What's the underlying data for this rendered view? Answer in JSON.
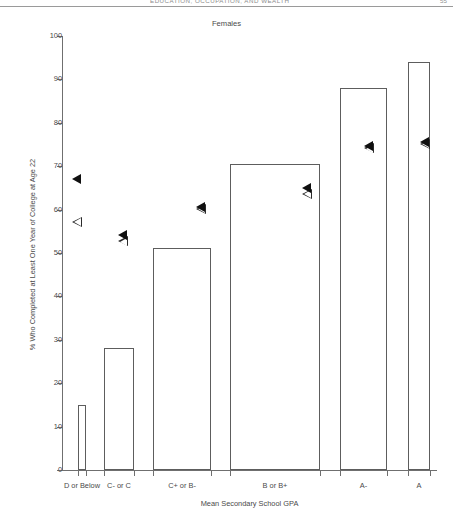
{
  "running_head": {
    "text": "EDUCATION, OCCUPATION, AND WEALTH",
    "page_number": "55"
  },
  "figure": {
    "title": "Females"
  },
  "chart_data": {
    "type": "bar",
    "title": "Females",
    "xlabel": "Mean Secondary School GPA",
    "ylabel": "% Who Completed at Least One Year of College at Age 22",
    "categories": [
      "D or Below",
      "C- or C",
      "C+ or B-",
      "B or B+",
      "A-",
      "A"
    ],
    "values": [
      15,
      28,
      51.2,
      70.5,
      88,
      94
    ],
    "ylim": [
      0,
      100
    ],
    "yticks": [
      0,
      10,
      20,
      30,
      40,
      50,
      60,
      70,
      80,
      90,
      100
    ],
    "ytick_labels": [
      "0",
      "10",
      "20",
      "30",
      "40",
      "50",
      "60",
      "70",
      "80",
      "90",
      "100"
    ],
    "grid": false,
    "legend": "none",
    "bar_widths_note": "Bar width varies by category, proportional to group sample size",
    "series": [
      {
        "name": "Bar: % completed at least one year of college",
        "marker": "bar-outline",
        "values": [
          15,
          28,
          51.2,
          70.5,
          88,
          94
        ]
      },
      {
        "name": "Filled triangle marker",
        "marker": "filled-left-triangle",
        "values": [
          67,
          54,
          60.5,
          65,
          74.5,
          75.5
        ]
      },
      {
        "name": "Open triangle marker",
        "marker": "open-left-triangle",
        "values": [
          57,
          52.5,
          60,
          63.5,
          74,
          75
        ]
      }
    ]
  }
}
